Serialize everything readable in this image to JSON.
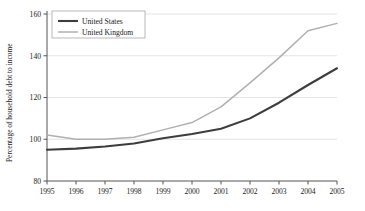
{
  "chart_data": {
    "type": "line",
    "title": "",
    "xlabel": "",
    "ylabel": "Percentage of household debt to income",
    "x": [
      1995,
      1996,
      1997,
      1998,
      1999,
      2000,
      2001,
      2002,
      2003,
      2004,
      2005
    ],
    "xticklabels": [
      "1995",
      "1996",
      "1997",
      "1998",
      "1999",
      "2000",
      "2001",
      "2002",
      "2003",
      "2004",
      "2005"
    ],
    "yticklabels": [
      "80",
      "100",
      "120",
      "140",
      "160"
    ],
    "ytickvalues": [
      80,
      100,
      120,
      140,
      160
    ],
    "ylim": [
      80,
      160
    ],
    "xlim": [
      1995,
      2005
    ],
    "grid": "horizontal",
    "legend_position": "top-left",
    "series": [
      {
        "name": "United States",
        "color": "#3d3d3d",
        "width": 2.1,
        "values": [
          95.0,
          95.5,
          96.5,
          98.0,
          100.5,
          102.5,
          105.0,
          110.0,
          117.5,
          126.0,
          134.0
        ]
      },
      {
        "name": "United Kingdom",
        "color": "#b0b0b0",
        "width": 1.5,
        "values": [
          102.0,
          100.0,
          100.0,
          101.0,
          104.5,
          108.0,
          115.5,
          127.0,
          139.0,
          152.0,
          155.5
        ]
      }
    ]
  },
  "legend": {
    "entries": [
      {
        "label": "United States"
      },
      {
        "label": "United Kingdom"
      }
    ]
  },
  "axes": {
    "y_axis_title": "Percentage of household debt to income"
  },
  "colors": {
    "us_line": "#3d3d3d",
    "uk_line": "#b0b0b0",
    "grid": "#d8d8d8",
    "axis": "#555555",
    "background": "#ffffff"
  }
}
